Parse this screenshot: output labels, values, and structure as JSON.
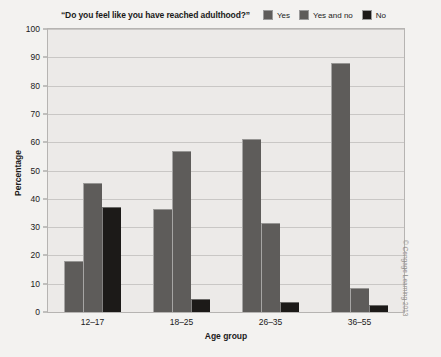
{
  "chart_data": {
    "type": "bar",
    "title": "“Do you feel like you have reached adulthood?”",
    "xlabel": "Age group",
    "ylabel": "Percentage",
    "categories": [
      "12–17",
      "18–25",
      "26–35",
      "36–55"
    ],
    "series": [
      {
        "name": "Yes",
        "values": [
          18,
          36.5,
          61,
          88
        ],
        "color": "#5e5c5a"
      },
      {
        "name": "Yes and no",
        "values": [
          45.5,
          57,
          31.5,
          8.5
        ],
        "color": "#5e5c5a"
      },
      {
        "name": "No",
        "values": [
          37,
          4.5,
          3.5,
          2.5
        ],
        "color": "#1c1a18"
      }
    ],
    "ylim": [
      0,
      100
    ],
    "yticks": [
      0,
      10,
      20,
      30,
      40,
      50,
      60,
      70,
      80,
      90,
      100
    ],
    "grid": true,
    "legend_position": "top"
  },
  "credit": "© Cengage Learning 2013",
  "colors": {
    "background": "#f3f2f0",
    "plot_background": "#eceae8",
    "gridline": "#c9c7c5",
    "frame": "#b6b4b2",
    "bar_yes": "#5e5c5a",
    "bar_yes_and_no": "#5e5c5a",
    "bar_no": "#1c1a18",
    "text": "#1a1a1a"
  }
}
